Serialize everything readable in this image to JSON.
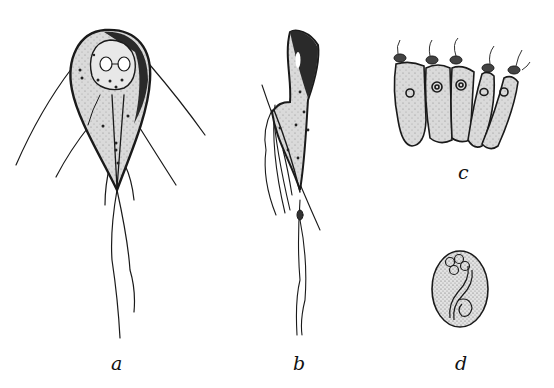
{
  "figure": {
    "panels": [
      {
        "id": "a",
        "label": "a",
        "subject": "trophozoite-front-view"
      },
      {
        "id": "b",
        "label": "b",
        "subject": "trophozoite-side-view"
      },
      {
        "id": "c",
        "label": "c",
        "subject": "attached-to-epithelial-cells"
      },
      {
        "id": "d",
        "label": "d",
        "subject": "cyst"
      }
    ],
    "colors": {
      "ink": "#1a1a1a",
      "body_fill": "#d4d4d4",
      "background": "#ffffff"
    }
  }
}
